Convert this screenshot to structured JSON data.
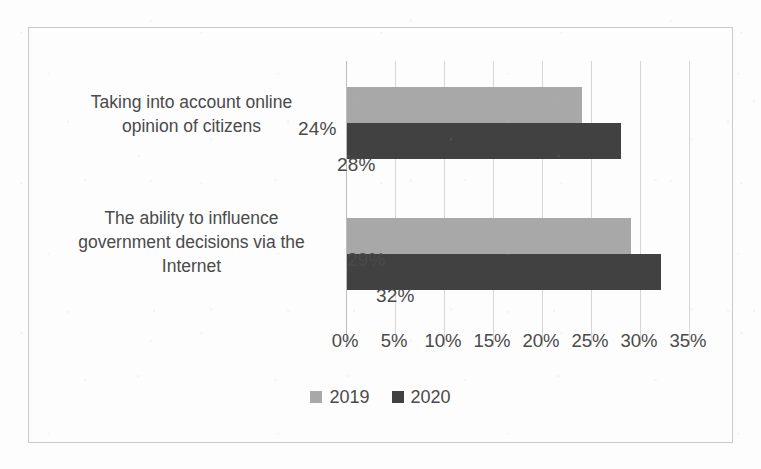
{
  "chart_data": {
    "type": "bar",
    "orientation": "horizontal",
    "title": "",
    "xlabel": "",
    "ylabel": "",
    "xlim": [
      0,
      35
    ],
    "xticks": [
      0,
      5,
      10,
      15,
      20,
      25,
      30,
      35
    ],
    "xtick_labels": [
      "0%",
      "5%",
      "10%",
      "15%",
      "20%",
      "25%",
      "30%",
      "35%"
    ],
    "grid": true,
    "legend_position": "bottom",
    "categories": [
      "Taking into account online opinion of citizens",
      "The ability to influence government decisions via the Internet"
    ],
    "category_lines": [
      [
        "Taking into account online",
        "opinion of citizens"
      ],
      [
        "The ability to influence",
        "government decisions via the",
        "Internet"
      ]
    ],
    "series": [
      {
        "name": "2019",
        "color": "#a8a8a8",
        "values": [
          24,
          29
        ],
        "value_labels": [
          "24%",
          "29%"
        ]
      },
      {
        "name": "2020",
        "color": "#414141",
        "values": [
          28,
          32
        ],
        "value_labels": [
          "28%",
          "32%"
        ]
      }
    ]
  },
  "legend": {
    "entries": [
      {
        "label": "2019",
        "color": "#a8a8a8"
      },
      {
        "label": "2020",
        "color": "#414141"
      }
    ]
  },
  "colors": {
    "series_2019": "#a8a8a8",
    "series_2020": "#414141",
    "gridline": "#d6d6d6",
    "frame_border": "#c9c9c9",
    "text": "#4a4a4a",
    "background": "#fdfdfd"
  }
}
